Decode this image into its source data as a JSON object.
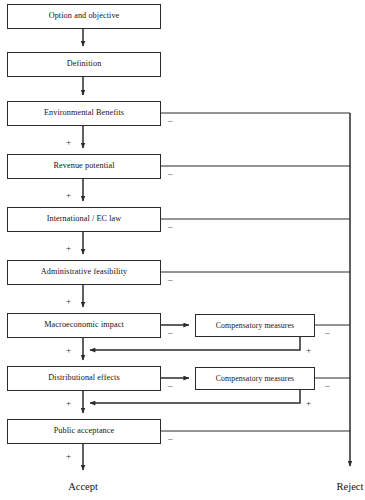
{
  "diagram": {
    "canvas": {
      "width": 365,
      "height": 500
    },
    "colors": {
      "stroke": "#2b2b2b",
      "text": "#141414",
      "background": "#ffffff"
    }
  },
  "main_nodes": [
    {
      "id": "option-and-objective",
      "label": "Option and objective",
      "top": 4,
      "has_reject_branch": false,
      "has_plus_below": false,
      "has_compensatory": false
    },
    {
      "id": "definition",
      "label": "Definition",
      "top": 52,
      "has_reject_branch": false,
      "has_plus_below": false,
      "has_compensatory": false
    },
    {
      "id": "environmental-benefits",
      "label": "Environmental Benefits",
      "top": 101,
      "has_reject_branch": true,
      "has_plus_below": true,
      "has_compensatory": false
    },
    {
      "id": "revenue-potential",
      "label": "Revenue potential",
      "top": 154,
      "has_reject_branch": true,
      "has_plus_below": true,
      "has_compensatory": false
    },
    {
      "id": "international-ec-law",
      "label": "International / EC law",
      "top": 207,
      "has_reject_branch": true,
      "has_plus_below": true,
      "has_compensatory": false
    },
    {
      "id": "administrative-feasibility",
      "label": "Administrative feasibility",
      "top": 260,
      "has_reject_branch": true,
      "has_plus_below": true,
      "has_compensatory": false
    },
    {
      "id": "macroeconomic-impact",
      "label": "Macroeconomic impact",
      "top": 313,
      "has_reject_branch": true,
      "has_plus_below": true,
      "has_compensatory": true
    },
    {
      "id": "distributional-effects",
      "label": "Distributional effects",
      "top": 366,
      "has_reject_branch": true,
      "has_plus_below": true,
      "has_compensatory": true
    },
    {
      "id": "public-acceptance",
      "label": "Public acceptance",
      "top": 419,
      "has_reject_branch": true,
      "has_plus_below": true,
      "has_compensatory": false
    }
  ],
  "compensatory_nodes": [
    {
      "id": "compensatory-measures-macroeconomic",
      "label": "Compensatory measures",
      "top": 314,
      "parent": "macroeconomic-impact"
    },
    {
      "id": "compensatory-measures-distributional",
      "label": "Compensatory measures",
      "top": 367,
      "parent": "distributional-effects"
    }
  ],
  "signs": {
    "minus": "–",
    "plus": "+"
  },
  "minus_labels": [
    {
      "for": "environmental-benefits",
      "text": "–",
      "x": 168,
      "y": 116
    },
    {
      "for": "revenue-potential",
      "text": "–",
      "x": 168,
      "y": 169
    },
    {
      "for": "international-ec-law",
      "text": "–",
      "x": 168,
      "y": 222
    },
    {
      "for": "administrative-feasibility",
      "text": "–",
      "x": 168,
      "y": 275
    },
    {
      "for": "macroeconomic-impact",
      "text": "–",
      "x": 168,
      "y": 328
    },
    {
      "for": "distributional-effects",
      "text": "–",
      "x": 168,
      "y": 381
    },
    {
      "for": "public-acceptance",
      "text": "–",
      "x": 168,
      "y": 434
    },
    {
      "for": "compensatory-measures-macroeconomic",
      "text": "–",
      "x": 325,
      "y": 328
    },
    {
      "for": "compensatory-measures-distributional",
      "text": "–",
      "x": 325,
      "y": 381
    }
  ],
  "plus_labels": [
    {
      "for": "environmental-benefits",
      "text": "+",
      "x": 66,
      "y": 138
    },
    {
      "for": "revenue-potential",
      "text": "+",
      "x": 66,
      "y": 191
    },
    {
      "for": "international-ec-law",
      "text": "+",
      "x": 66,
      "y": 244
    },
    {
      "for": "administrative-feasibility",
      "text": "+",
      "x": 66,
      "y": 297
    },
    {
      "for": "macroeconomic-impact",
      "text": "+",
      "x": 66,
      "y": 346
    },
    {
      "for": "distributional-effects",
      "text": "+",
      "x": 66,
      "y": 399
    },
    {
      "for": "public-acceptance",
      "text": "+",
      "x": 66,
      "y": 452
    },
    {
      "for": "compensatory-measures-macroeconomic",
      "text": "+",
      "x": 306,
      "y": 346
    },
    {
      "for": "compensatory-measures-distributional",
      "text": "+",
      "x": 306,
      "y": 399
    }
  ],
  "terminals": [
    {
      "id": "accept",
      "label": "Accept",
      "x": 83,
      "y": 482,
      "anchor": "center"
    },
    {
      "id": "reject",
      "label": "Reject",
      "x": 350,
      "y": 482,
      "anchor": "center"
    }
  ],
  "geometry": {
    "spine_x": 83,
    "reject_bus_x": 350,
    "reject_bus_top": 113,
    "reject_bus_bottom": 466,
    "box_left": 7,
    "box_right": 161,
    "comp_left": 195,
    "comp_right": 315,
    "comp_return_x": 300
  }
}
